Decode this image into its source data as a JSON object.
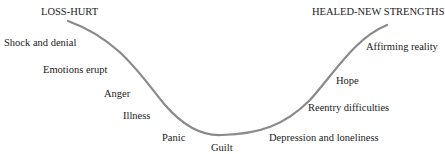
{
  "diagram": {
    "type": "grief-recovery-curve",
    "curve_color": "#8a8a8a",
    "start_label": "LOSS-HURT",
    "end_label": "HEALED-NEW STRENGTHS",
    "descending_stages": [
      "Shock and denial",
      "Emotions erupt",
      "Anger",
      "Illness",
      "Panic"
    ],
    "bottom_stage": "Guilt",
    "ascending_stages": [
      "Depression and loneliness",
      "Reentry difficulties",
      "Hope",
      "Affirming reality"
    ]
  }
}
